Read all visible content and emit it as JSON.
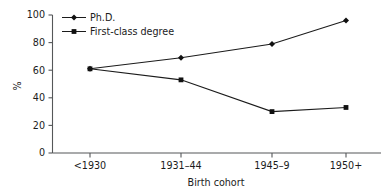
{
  "chart_data": {
    "type": "line",
    "title": "",
    "subtitle": "",
    "xlabel": "Birth cohort",
    "ylabel": "%",
    "categories": [
      "<1930",
      "1931–44",
      "1945–9",
      "1950+"
    ],
    "ylim": [
      0,
      100
    ],
    "yticks": [
      0,
      20,
      40,
      60,
      80,
      100
    ],
    "ytick_labels": [
      "0",
      "20",
      "40",
      "60",
      "80",
      "100"
    ],
    "grid": false,
    "legend_position": "top-left-inside",
    "series": [
      {
        "name": "Ph.D.",
        "marker": "diamond",
        "color": "#111111",
        "values": [
          61,
          69,
          79,
          96
        ]
      },
      {
        "name": "First-class degree",
        "marker": "square",
        "color": "#111111",
        "values": [
          61,
          53,
          30,
          33
        ]
      }
    ]
  },
  "legend": {
    "entries": [
      {
        "label": "Ph.D."
      },
      {
        "label": "First-class degree"
      }
    ]
  },
  "axes": {
    "y_title": "%",
    "x_title": "Birth cohort",
    "y_tick_0": "0",
    "y_tick_1": "20",
    "y_tick_2": "40",
    "y_tick_3": "60",
    "y_tick_4": "80",
    "y_tick_5": "100",
    "x_tick_0": "<1930",
    "x_tick_1": "1931–44",
    "x_tick_2": "1945–9",
    "x_tick_3": "1950+"
  },
  "colors": {
    "background": "#ffffff",
    "ink": "#1b1b1b",
    "axis": "#555759"
  }
}
